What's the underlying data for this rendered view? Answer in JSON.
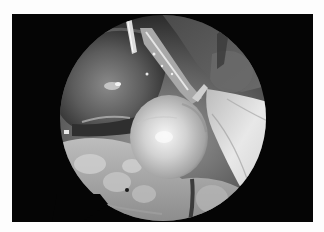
{
  "image": {
    "description": "Grayscale laparoscopic view inside a circular endoscope field on a black rectangular frame with white page margin",
    "mode": "grayscale",
    "colors": {
      "page_background": "#fdfdfd",
      "frame_background": "#050505",
      "tissue_dark": "#3a3a3a",
      "tissue_mid": "#8a8a8a",
      "tissue_light": "#d8d8d8",
      "highlight": "#f4f4f4"
    },
    "regions": [
      {
        "name": "circular-endoscope-field",
        "center": [
          151,
          104
        ],
        "radius": 103
      },
      {
        "name": "bright-spherical-cyst",
        "center": [
          157,
          123
        ],
        "rx": 39,
        "ry": 42
      },
      {
        "name": "dark-uterine-mass",
        "position": "left-upper"
      },
      {
        "name": "surgical-instrument",
        "position": "upper-center"
      },
      {
        "name": "tubular-structure",
        "position": "diagonal upper-center to center"
      },
      {
        "name": "white-peritoneal-fold",
        "position": "right"
      },
      {
        "name": "bowel-loops",
        "position": "bottom"
      }
    ]
  }
}
